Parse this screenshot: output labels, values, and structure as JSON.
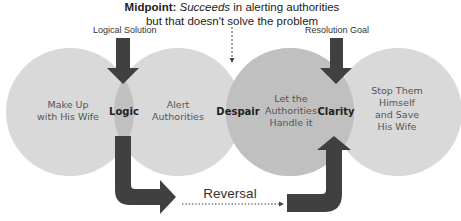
{
  "diagram": {
    "type": "venn-sequence",
    "colors": {
      "circle_fill": "#d9d9d9",
      "lens_fill": "#bfbfbf",
      "arrow_fill": "#404040",
      "background": "#ffffff"
    },
    "midpoint": {
      "label": "Midpoint:",
      "emphasis": "Succeeds",
      "rest_line1": " in alerting authorities",
      "line2": "but that doesn't solve the problem"
    },
    "annotations": {
      "logical_solution": "Logical Solution",
      "resolution_goal": "Resolution Goal",
      "reversal": "Reversal"
    },
    "circles": [
      {
        "line1": "Make Up",
        "line2": "with His Wife"
      },
      {
        "line1": "Alert",
        "line2": "Authorities"
      },
      {
        "line1": "Let the",
        "line2": "Authorities",
        "line3": "Handle it"
      },
      {
        "line1": "Stop Them",
        "line2": "Himself",
        "line3": "and Save",
        "line4": "His Wife"
      }
    ],
    "lenses": [
      {
        "label": "Logic"
      },
      {
        "label": "Despair"
      },
      {
        "label": "Clarity"
      }
    ]
  }
}
